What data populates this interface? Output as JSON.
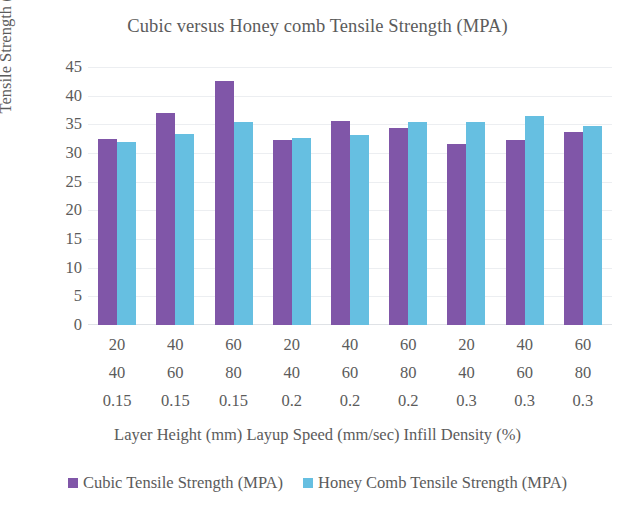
{
  "chart_data": {
    "type": "bar",
    "title": "Cubic versus Honey comb Tensile Strength (MPA)",
    "xlabel": "Layer Height (mm) Layup Speed (mm/sec) Infill Density (%)",
    "ylabel": "Tensile Strength (MPA)",
    "ylim": [
      0,
      45
    ],
    "ytick_step": 5,
    "yticks": [
      "45",
      "40",
      "35",
      "30",
      "25",
      "20",
      "15",
      "10",
      "5",
      "0"
    ],
    "grid": true,
    "legend_position": "bottom",
    "categories": [
      "1",
      "2",
      "3",
      "4",
      "5",
      "6",
      "7",
      "8",
      "9"
    ],
    "category_rows": [
      {
        "name": "layer-height-row",
        "values": [
          "20",
          "40",
          "60",
          "20",
          "40",
          "60",
          "20",
          "40",
          "60"
        ]
      },
      {
        "name": "layup-speed-row",
        "values": [
          "40",
          "60",
          "80",
          "40",
          "60",
          "80",
          "40",
          "60",
          "80"
        ]
      },
      {
        "name": "infill-density-row",
        "values": [
          "0.15",
          "0.15",
          "0.15",
          "0.2",
          "0.2",
          "0.2",
          "0.3",
          "0.3",
          "0.3"
        ]
      }
    ],
    "series": [
      {
        "name": "Cubic Tensile Strength (MPA)",
        "color": "#8056a8",
        "values": [
          32.4,
          37.0,
          42.6,
          32.3,
          35.6,
          34.4,
          31.6,
          32.3,
          33.7
        ]
      },
      {
        "name": "Honey Comb Tensile Strength (MPA)",
        "color": "#66bfe1",
        "values": [
          31.9,
          33.3,
          35.4,
          32.6,
          33.1,
          35.4,
          35.4,
          36.5,
          34.7
        ]
      }
    ]
  },
  "legend": [
    {
      "label": "Cubic Tensile Strength (MPA)",
      "color": "#8056a8"
    },
    {
      "label": "Honey Comb Tensile Strength (MPA)",
      "color": "#66bfe1"
    }
  ]
}
